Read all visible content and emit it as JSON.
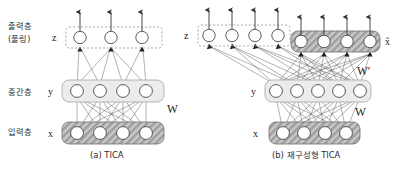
{
  "figure": {
    "title_visible": false,
    "background_color": "#ffffff",
    "row_labels": [
      {
        "id": "output",
        "text": "출력층",
        "text2": "(풀링)"
      },
      {
        "id": "hidden",
        "text": "중간층"
      },
      {
        "id": "input",
        "text": "입력층"
      }
    ],
    "panels": [
      {
        "id": "panel-a",
        "caption": "(a) TICA",
        "layers": [
          {
            "id": "a-z",
            "var": "z",
            "units": 3,
            "box_style": "dashed",
            "arrows_up": 3
          },
          {
            "id": "a-y",
            "var": "y",
            "units": 4,
            "box_style": "light-gray",
            "arrows_up": 0
          },
          {
            "id": "a-x",
            "var": "x",
            "units": 4,
            "box_style": "hatched",
            "arrows_up": 0
          }
        ],
        "weights": [
          {
            "id": "a-W",
            "label": "W"
          }
        ]
      },
      {
        "id": "panel-b",
        "caption": "(b) 재구성형 TICA",
        "layers": [
          {
            "id": "b-z",
            "var": "z",
            "units": 4,
            "box_style": "dashed",
            "arrows_up": 4
          },
          {
            "id": "b-xhat",
            "var": "x̂",
            "units": 4,
            "box_style": "hatched",
            "arrows_up": 4
          },
          {
            "id": "b-y",
            "var": "y",
            "units": 5,
            "box_style": "light-gray",
            "arrows_up": 0
          },
          {
            "id": "b-x",
            "var": "x",
            "units": 4,
            "box_style": "hatched",
            "arrows_up": 0
          }
        ],
        "weights": [
          {
            "id": "b-W",
            "label": "W"
          },
          {
            "id": "b-Wprime",
            "label": "W′"
          }
        ]
      }
    ],
    "colors": {
      "stroke": "#333333",
      "node_fill": "#ffffff",
      "gray_box_fill": "#ececec",
      "gray_box_stroke": "#9a9a9a",
      "hatch_fill": "#b8b8b8",
      "dashed_stroke": "#999999",
      "line": "#444444"
    }
  }
}
